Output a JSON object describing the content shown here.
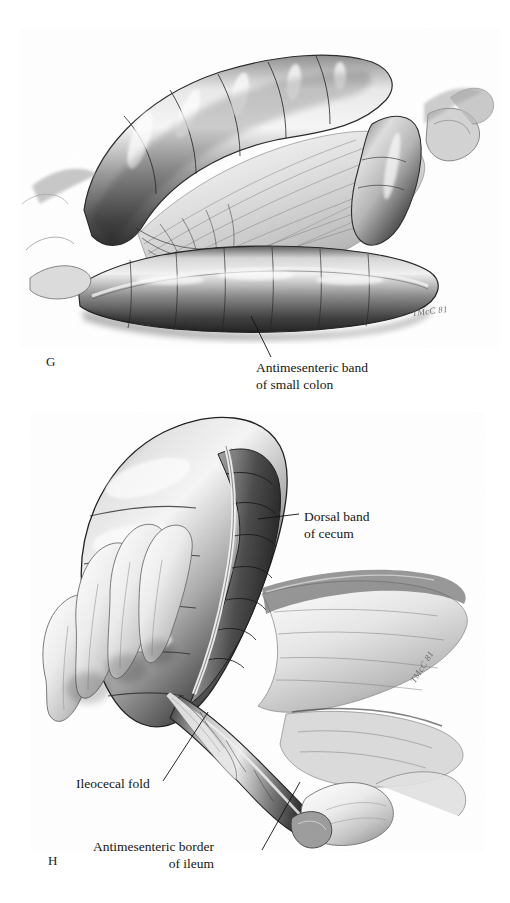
{
  "plate": {
    "background_color": "#ffffff",
    "ink_color": "#161616",
    "medium": "graphite pencil rendering, grayscale"
  },
  "panels": [
    {
      "letter": "G",
      "subject": "Antimesenteric band of small colon",
      "signature": "TMcC 81",
      "labels": [
        {
          "name": "antimesenteric-band-of-small-colon",
          "line1": "Antimesenteric band",
          "line2": "of small colon",
          "align": "left"
        }
      ]
    },
    {
      "letter": "H",
      "subject": "Dorsal band of cecum, ileocecal fold and antimesenteric border of ileum",
      "signature": "TMcC 81",
      "labels": [
        {
          "name": "dorsal-band-of-cecum",
          "line1": "Dorsal band",
          "line2": "of cecum",
          "align": "left"
        },
        {
          "name": "ileocecal-fold",
          "line1": "Ileocecal fold",
          "line2": "",
          "align": "left"
        },
        {
          "name": "antimesenteric-border-of-ileum",
          "line1": "Antimesenteric border",
          "line2": "of ileum",
          "align": "right"
        }
      ]
    }
  ],
  "labels": {
    "antimesenteric_band_l1": "Antimesenteric band",
    "antimesenteric_band_l2": "of small colon",
    "dorsal_band_l1": "Dorsal band",
    "dorsal_band_l2": "of cecum",
    "ileocecal_fold": "Ileocecal fold",
    "antimesenteric_ileum_l1": "Antimesenteric border",
    "antimesenteric_ileum_l2": "of ileum"
  },
  "letters": {
    "g": "G",
    "h": "H"
  },
  "signatures": {
    "panel_g": "TMcC 81",
    "panel_h": "TMcC 81"
  }
}
